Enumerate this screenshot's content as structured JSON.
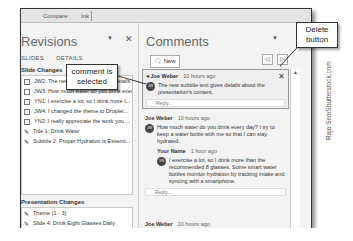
{
  "topbar": {
    "left_text": "Compare",
    "right_text": "Ink"
  },
  "revisions": {
    "title": "Revisions",
    "dropdown_icon": "chevron-down-icon",
    "close_icon": "close-icon",
    "tabs": [
      "SLIDES",
      "DETAILS"
    ],
    "slide_changes_label": "Slide Changes",
    "slide_changes": [
      "JW2: The new subtitle text gives details...",
      "JW3: How much water do you drink every...",
      "YN1: I exercise a lot, so I drink more t...",
      "JW4: I changed the theme to Droplet...",
      "YN2: I really appreciate the work you ...",
      "Title 1: Drink Water",
      "Subtitle 2: Proper Hydration is Essenti..."
    ],
    "presentation_changes_label": "Presentation Changes",
    "presentation_changes": [
      "Theme (1 - 3)",
      "Slide 4: Drink Eight Glasses Daily",
      "Inserted Slide: Eight Glasses D..."
    ]
  },
  "comments": {
    "title": "Comments",
    "new_button": "New",
    "items": [
      {
        "author": "Joe Weber",
        "time": "10 hours ago",
        "initials": "JW",
        "text": "The new subtitle text gives details about the presentation's content.",
        "reply_placeholder": "Reply..."
      },
      {
        "author": "Joe Weber",
        "time": "10 hours ago",
        "initials": "JW",
        "text": "How much water do you drink every day? I try to keep a water bottle with me so that I can stay hydrated.",
        "reply": {
          "author": "Your Name",
          "time": "1 hour ago",
          "initials": "YN",
          "text": "I exercise a lot, so I drink more than the recommended 8 glasses. Some smart water bottles monitor hydration by tracking intake and syncing with a smartphone."
        },
        "reply_placeholder": "Reply..."
      },
      {
        "author": "Joe Weber",
        "time": "10 hours ago"
      }
    ]
  },
  "callouts": {
    "comment_selected": "comment is selected",
    "delete_button": "Delete button"
  },
  "credit": "Raja Sen/Shutterstock.com"
}
